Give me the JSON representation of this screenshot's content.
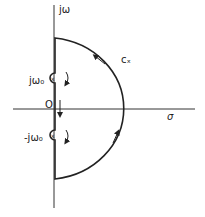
{
  "diagram": {
    "type": "contour",
    "labels": {
      "imag_axis": "jω",
      "real_axis": "σ",
      "origin": "O",
      "contour": "cₓ",
      "pole_upper": "jω₀",
      "pole_lower": "-jω₀"
    },
    "colors": {
      "line": "#222222",
      "background": "#ffffff"
    }
  }
}
